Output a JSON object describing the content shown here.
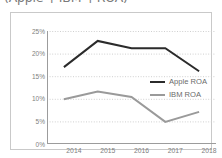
{
  "chart_data": {
    "type": "line",
    "title": "(Apple과 IBM의 ROA)",
    "xlabel": "",
    "ylabel": "",
    "categories": [
      "2014",
      "2015",
      "2016",
      "2017",
      "2018"
    ],
    "series": [
      {
        "name": "Apple ROA",
        "color": "#2b2b2b",
        "values": [
          17.0,
          22.8,
          21.2,
          21.2,
          16.1
        ]
      },
      {
        "name": "IBM ROA",
        "color": "#9a9a9a",
        "values": [
          9.9,
          11.6,
          10.4,
          4.9,
          7.1
        ]
      }
    ],
    "ylim": [
      0,
      25
    ],
    "ytick_values": [
      0,
      5,
      10,
      15,
      20,
      25
    ],
    "ytick_labels": [
      "0%",
      "5%",
      "10%",
      "15%",
      "20%",
      "25%"
    ],
    "grid": true,
    "grid_style": "dotted",
    "grid_color": "#cfcfcf",
    "axis_color": "#9c9c9c",
    "legend_position": "center-right",
    "frame_border_color": "#c9c9c9",
    "background": "#ffffff"
  }
}
